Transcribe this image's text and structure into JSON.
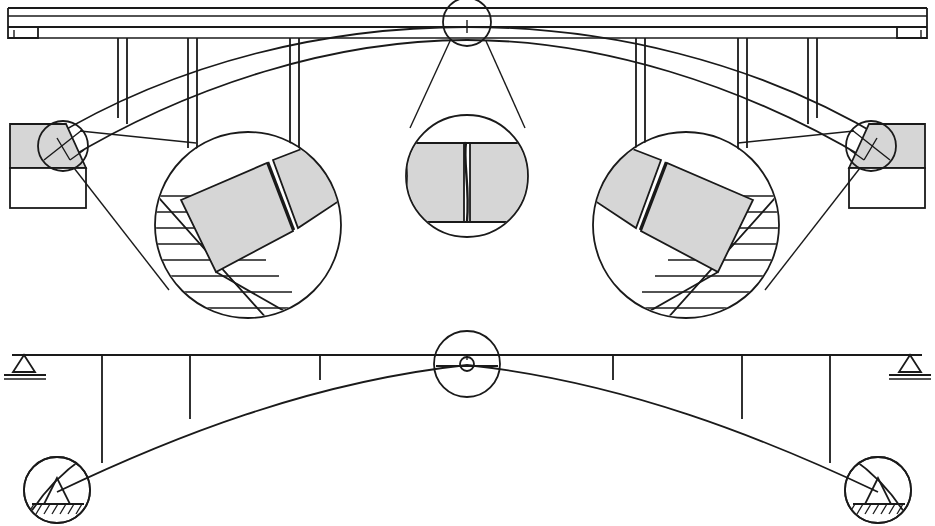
{
  "drawing": {
    "title": "Arch bridge elevation with hinge details and structural line diagram",
    "type": "engineering-elevation-drawing",
    "canvas": {
      "width": 935,
      "height": 526
    },
    "background_color": "#ffffff",
    "line_color": "#1a1a1a",
    "shade_color": "#d6d6d6",
    "panels": [
      {
        "name": "elevation",
        "label": "Arch bridge elevation with deck, spandrel columns and callout details",
        "y_range": [
          0,
          330
        ]
      },
      {
        "name": "line-diagram",
        "label": "Three-hinged arch structural line diagram",
        "y_range": [
          330,
          526
        ]
      }
    ]
  },
  "elevation": {
    "deck": {
      "name": "bridge-deck",
      "top_y": 8,
      "slab_lines_y": [
        8,
        16,
        28,
        38
      ],
      "left_x": 8,
      "right_x": 927,
      "left_end_block": {
        "x": 8,
        "y": 8,
        "w": 30,
        "h": 32
      },
      "right_end_block": {
        "x": 897,
        "y": 8,
        "w": 30,
        "h": 32
      }
    },
    "spandrel_columns": [
      {
        "name": "column-1",
        "x": 118,
        "top": 38,
        "bottom": 120,
        "width": 9
      },
      {
        "name": "column-2",
        "x": 188,
        "top": 38,
        "bottom": 150,
        "width": 9
      },
      {
        "name": "column-3",
        "x": 290,
        "top": 38,
        "bottom": 182,
        "width": 9
      },
      {
        "name": "column-4",
        "x": 645,
        "top": 38,
        "bottom": 182,
        "width": 9
      },
      {
        "name": "column-5",
        "x": 747,
        "top": 38,
        "bottom": 150,
        "width": 9
      },
      {
        "name": "column-6",
        "x": 817,
        "top": 38,
        "bottom": 120,
        "width": 9
      }
    ],
    "arch_rib": {
      "name": "arch-rib",
      "springing_left": {
        "x": 55,
        "y": 148
      },
      "springing_right": {
        "x": 880,
        "y": 148
      },
      "crown": {
        "x": 467,
        "y": 32
      },
      "rib_thickness_crown": 10,
      "rib_thickness_springing": 22
    },
    "abutments": [
      {
        "name": "abutment-left",
        "wedge": "shaded triangular wedge",
        "base_block": {
          "x": 8,
          "y": 168,
          "w": 78,
          "h": 40
        },
        "shaded": true
      },
      {
        "name": "abutment-right",
        "wedge": "shaded triangular wedge",
        "base_block": {
          "x": 849,
          "y": 168,
          "w": 78,
          "h": 40
        },
        "shaded": true
      }
    ],
    "hinge_markers": [
      {
        "name": "hinge-marker-left-springing",
        "cx": 63,
        "cy": 146,
        "r": 25
      },
      {
        "name": "hinge-marker-crown",
        "cx": 467,
        "cy": 22,
        "r": 24
      },
      {
        "name": "hinge-marker-right-springing",
        "cx": 871,
        "cy": 146,
        "r": 25
      }
    ]
  },
  "details": [
    {
      "name": "detail-left-springing-hinge",
      "label": "Left springing hinge detail",
      "circle": {
        "cx": 248,
        "cy": 225,
        "r": 93
      },
      "source_marker": {
        "cx": 63,
        "cy": 146,
        "r": 25
      },
      "features": [
        "hatched-foundation",
        "shaded-block-lower",
        "shaded-block-upper",
        "hinge-joint-gap"
      ],
      "block_rotation_deg": -28
    },
    {
      "name": "detail-crown-hinge",
      "label": "Crown hinge detail",
      "circle": {
        "cx": 467,
        "cy": 176,
        "r": 61
      },
      "source_marker": {
        "cx": 467,
        "cy": 22,
        "r": 24
      },
      "features": [
        "shaded-block-left",
        "shaded-block-right",
        "vertical-hinge-joint"
      ],
      "block_rotation_deg": 0
    },
    {
      "name": "detail-right-springing-hinge",
      "label": "Right springing hinge detail",
      "circle": {
        "cx": 686,
        "cy": 225,
        "r": 93
      },
      "source_marker": {
        "cx": 871,
        "cy": 146,
        "r": 25
      },
      "features": [
        "hatched-foundation",
        "shaded-block-lower",
        "shaded-block-upper",
        "hinge-joint-gap"
      ],
      "block_rotation_deg": 28
    }
  ],
  "line_diagram": {
    "name": "three-hinged-arch-line-diagram",
    "deck_line": {
      "y": 355,
      "x_start": 12,
      "x_end": 922
    },
    "supports": [
      {
        "name": "deck-support-left",
        "type": "pin-triangle-on-ground",
        "x": 24,
        "y": 355
      },
      {
        "name": "deck-support-right",
        "type": "pin-triangle-on-ground",
        "x": 910,
        "y": 355
      }
    ],
    "arch": {
      "name": "arch-axis",
      "springing_left": {
        "x": 57,
        "y": 492
      },
      "springing_right": {
        "x": 878,
        "y": 492
      },
      "crown": {
        "x": 467,
        "y": 364
      }
    },
    "hangers": [
      {
        "name": "hanger-1",
        "x": 102,
        "top": 355,
        "bottom": 455
      },
      {
        "name": "hanger-2",
        "x": 190,
        "top": 355,
        "bottom": 418
      },
      {
        "name": "hanger-3",
        "x": 320,
        "top": 355,
        "bottom": 378
      },
      {
        "name": "hanger-4",
        "x": 613,
        "top": 355,
        "bottom": 378
      },
      {
        "name": "hanger-5",
        "x": 742,
        "top": 355,
        "bottom": 418
      },
      {
        "name": "hanger-6",
        "x": 830,
        "top": 355,
        "bottom": 455
      }
    ],
    "hinges": [
      {
        "name": "crown-hinge-callout",
        "cx": 467,
        "cy": 364,
        "r": 33,
        "pin_r": 7,
        "type": "pin-hinge"
      },
      {
        "name": "left-base-hinge-callout",
        "cx": 57,
        "cy": 490,
        "r": 33,
        "type": "fixed-pin-on-hatched-ground"
      },
      {
        "name": "right-base-hinge-callout",
        "cx": 878,
        "cy": 490,
        "r": 33,
        "type": "fixed-pin-on-hatched-ground"
      }
    ]
  }
}
